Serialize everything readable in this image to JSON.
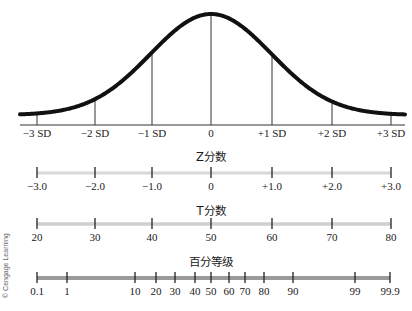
{
  "figure": {
    "curve": {
      "type": "normal-distribution",
      "axis_labels": [
        "−3 SD",
        "−2 SD",
        "−1 SD",
        "0",
        "+1 SD",
        "+2 SD",
        "+3 SD"
      ],
      "tick_x": [
        37,
        95,
        152,
        211,
        272,
        332,
        391
      ]
    },
    "z_scale": {
      "title": "Z分数",
      "labels": [
        "−3.0",
        "−2.0",
        "−1.0",
        "0",
        "+1.0",
        "+2.0",
        "+3.0"
      ],
      "tick_x": [
        37,
        95,
        152,
        211,
        272,
        332,
        391
      ]
    },
    "t_scale": {
      "title": "T分数",
      "labels": [
        "20",
        "30",
        "40",
        "50",
        "60",
        "70",
        "80"
      ],
      "tick_x": [
        37,
        95,
        152,
        211,
        272,
        332,
        391
      ]
    },
    "percentile_scale": {
      "title": "百分等级",
      "labels": [
        "0.1",
        "1",
        "10",
        "20",
        "30",
        "40",
        "50",
        "60",
        "70",
        "80",
        "90",
        "99",
        "99.9"
      ],
      "tick_x": [
        37,
        67,
        135,
        156,
        175,
        195,
        211,
        229,
        245,
        264,
        293,
        355,
        390
      ]
    },
    "copyright": "© Cengage Learning",
    "colors": {
      "curve": "#111111",
      "z_bar": "#d8d8d8",
      "t_bar": "#cfcfcf",
      "p_bar": "#9a9a9a"
    }
  }
}
